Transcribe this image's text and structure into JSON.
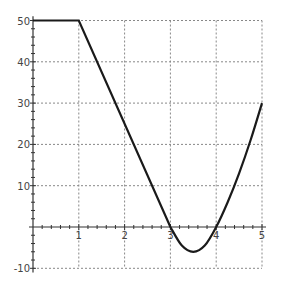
{
  "chart_data": {
    "type": "line",
    "title": "",
    "xlabel": "",
    "ylabel": "",
    "xlim": [
      0,
      5
    ],
    "ylim": [
      -10,
      50
    ],
    "grid": true,
    "x_ticks": [
      "1",
      "2",
      "3",
      "4",
      "5"
    ],
    "y_ticks": [
      "-10",
      "10",
      "20",
      "30",
      "40",
      "50"
    ],
    "series": [
      {
        "name": "f(x)",
        "x": [
          0,
          1,
          2,
          3,
          3.25,
          3.5,
          3.75,
          4,
          4.25,
          4.5,
          4.75,
          5
        ],
        "values": [
          50,
          50,
          25,
          0,
          -4.5,
          -6,
          -4.5,
          0,
          6,
          13,
          21,
          30
        ]
      }
    ],
    "colors": {
      "line": "#1a1a1a",
      "grid": "#888888",
      "axis": "#333333"
    }
  }
}
